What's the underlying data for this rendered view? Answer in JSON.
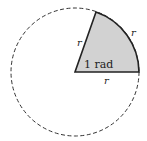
{
  "diagram": {
    "title": "",
    "circle": {
      "cx": 75,
      "cy": 72,
      "r": 64,
      "style": "dashed"
    },
    "sector": {
      "angle_label": "1 rad",
      "fill": "#d0d0d0",
      "stroke": "#222222"
    },
    "labels": {
      "radius_upper": "r",
      "arc": "r",
      "radius_lower": "r",
      "angle": "1 rad"
    }
  }
}
